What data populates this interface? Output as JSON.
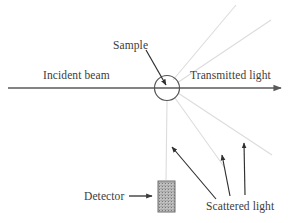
{
  "figure": {
    "background_color": "#ffffff",
    "width": 296,
    "height": 223
  },
  "labels": {
    "sample": "Sample",
    "incident_beam": "Incident beam",
    "transmitted_light": "Transmitted light",
    "detector": "Detector",
    "scattered_light": "Scattered light"
  },
  "colors": {
    "ink": "#3c3c3c",
    "beam": "#5a5a5a",
    "ray_faint": "#dcdcdc",
    "detector_fill": "#b4b4b4",
    "detector_border": "#6e6e6e",
    "sample_circle": "#555555"
  },
  "elements": {
    "incident_beam_arrow": {
      "name": "incident-and-transmitted-beam",
      "from": [
        8,
        88
      ],
      "to": [
        283,
        88
      ],
      "arrowhead": "right",
      "stroke": "#5a5a5a",
      "stroke_width": 1.4
    },
    "sample_circle": {
      "name": "sample-circle",
      "center": [
        167,
        88
      ],
      "radius": 12.5,
      "stroke": "#555555",
      "fill": "none"
    },
    "sample_pointer": {
      "name": "sample-pointer-arrow",
      "from": [
        147,
        50
      ],
      "to": [
        167,
        86
      ],
      "arrowhead": "end"
    },
    "detector_pointer": {
      "name": "detector-pointer-arrow",
      "from": [
        129,
        196
      ],
      "to": [
        153,
        196
      ],
      "arrowhead": "end"
    },
    "detector_box": {
      "name": "detector-rectangle",
      "x": 158,
      "y": 181,
      "width": 17,
      "height": 31,
      "fill_pattern": "stipple-gray"
    },
    "scattered_rays": [
      {
        "name": "scattered-ray-up-steep",
        "from": [
          173,
          80
        ],
        "to": [
          236,
          5
        ]
      },
      {
        "name": "scattered-ray-up-shallow",
        "from": [
          177,
          83
        ],
        "to": [
          271,
          20
        ]
      },
      {
        "name": "scattered-ray-down-shallow",
        "from": [
          178,
          93
        ],
        "to": [
          272,
          155
        ]
      },
      {
        "name": "scattered-ray-down-mid",
        "from": [
          175,
          98
        ],
        "to": [
          225,
          168
        ]
      },
      {
        "name": "scattered-ray-down-steep",
        "from": [
          167,
          101
        ],
        "to": [
          166,
          180
        ]
      }
    ],
    "scattered_pointers": [
      {
        "name": "scattered-pointer-left",
        "from": [
          216,
          199
        ],
        "to": [
          171,
          146
        ]
      },
      {
        "name": "scattered-pointer-middle",
        "from": [
          230,
          196
        ],
        "to": [
          222,
          154
        ]
      },
      {
        "name": "scattered-pointer-right",
        "from": [
          245,
          195
        ],
        "to": [
          244,
          142
        ]
      }
    ]
  }
}
